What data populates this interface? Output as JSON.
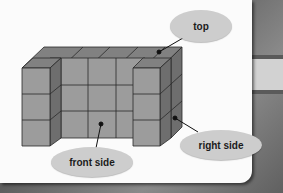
{
  "figure": {
    "labels": {
      "top": "top",
      "front": "front side",
      "right": "right side"
    },
    "colors": {
      "front_face": "#9c9c9c",
      "top_face": "#818181",
      "side_face": "#6e6e6e",
      "edge": "#2a2a2a",
      "label_bg": "#cdcdcd",
      "card_bg": "#fbfbfb"
    },
    "structure": {
      "back_wall_cubes_wide": 5,
      "height_cubes": 3,
      "front_columns": [
        "left",
        "right"
      ]
    }
  }
}
